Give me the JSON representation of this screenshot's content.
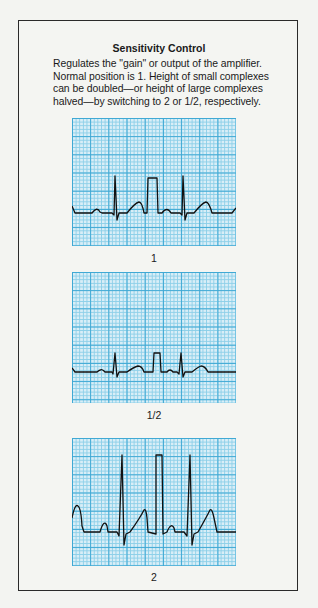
{
  "panel": {
    "title": "Sensitivity Control",
    "description_lines": [
      "Regulates the \"gain\" or output of the amplifier.",
      "Normal position is 1. Height of small complexes",
      "can be doubled—or height of large complexes",
      "halved—by switching to 2 or 1/2, respectively."
    ]
  },
  "strips": [
    {
      "label": "1",
      "gain": 1,
      "description": "Normal sensitivity ECG strip with calibration pulse"
    },
    {
      "label": "1/2",
      "gain": 0.5,
      "description": "Half sensitivity ECG strip, complexes halved"
    },
    {
      "label": "2",
      "gain": 2,
      "description": "Double sensitivity ECG strip, complexes doubled"
    }
  ],
  "colors": {
    "grid_background": "#d9eef7",
    "grid_minor_line": "#8ccfe8",
    "grid_major_line": "#3ea8d4",
    "trace": "#111111",
    "border": "#2a2a2a",
    "page_background": "#f3f4f1"
  }
}
